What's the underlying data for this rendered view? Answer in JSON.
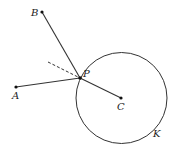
{
  "diagram": {
    "stroke_color": "#333333",
    "points": {
      "A": {
        "label": "A",
        "x": 16,
        "y": 87,
        "label_x": 12,
        "label_y": 99
      },
      "B": {
        "label": "B",
        "x": 42,
        "y": 12,
        "label_x": 31,
        "label_y": 16
      },
      "P": {
        "label": "P",
        "x": 80,
        "y": 78,
        "label_x": 83,
        "label_y": 77
      },
      "C": {
        "label": "C",
        "x": 121,
        "y": 98,
        "label_x": 117,
        "label_y": 110
      }
    },
    "circle": {
      "label": "K",
      "cx": 121.5,
      "cy": 98,
      "r": 45.5,
      "label_x": 153,
      "label_y": 137
    },
    "segments": [
      {
        "from": "B",
        "to": "P",
        "style": "solid"
      },
      {
        "from": "A",
        "to": "P",
        "style": "solid"
      },
      {
        "from": "P",
        "to": "C",
        "style": "solid"
      }
    ],
    "dashed_line": {
      "x1": 48,
      "y1": 62,
      "x2": 80,
      "y2": 78
    }
  }
}
